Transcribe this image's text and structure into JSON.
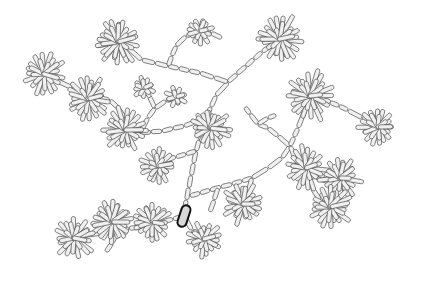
{
  "figure": {
    "width": 422,
    "height": 283,
    "background_color": "#ffffff",
    "rod_fill_color": "#f0f0f0",
    "rod_stroke_color": "#4a4a4a",
    "rod_stroke_width": 0.7,
    "highlight_fill_color": "#d8d8d8",
    "highlight_stroke_color": "#111111",
    "highlight_stroke_width": 2.0,
    "rod_width": 4.2,
    "cluster_rod_length": 15,
    "chain_rod_length": 13
  },
  "highlight": {
    "name": "highlighted-rod",
    "x": 184,
    "y": 216,
    "angle": 108,
    "length": 22,
    "width": 9
  },
  "chains": [
    {
      "name": "trunk-lower",
      "points": [
        [
          184,
          212
        ],
        [
          196,
          151
        ],
        [
          206,
          118
        ],
        [
          216,
          96
        ],
        [
          228,
          82
        ]
      ]
    },
    {
      "name": "trunk-upper-left-limb",
      "points": [
        [
          228,
          82
        ],
        [
          200,
          73
        ],
        [
          168,
          66
        ],
        [
          142,
          60
        ]
      ]
    },
    {
      "name": "branch-upper-left-top",
      "points": [
        [
          168,
          66
        ],
        [
          176,
          46
        ],
        [
          186,
          36
        ],
        [
          200,
          31
        ]
      ]
    },
    {
      "name": "branch-upper-left-mid",
      "points": [
        [
          142,
          60
        ],
        [
          128,
          48
        ],
        [
          118,
          42
        ]
      ]
    },
    {
      "name": "branch-top-right-stub",
      "points": [
        [
          200,
          31
        ],
        [
          211,
          33
        ],
        [
          222,
          38
        ]
      ]
    },
    {
      "name": "trunk-upper-right-limb",
      "points": [
        [
          228,
          82
        ],
        [
          246,
          66
        ],
        [
          262,
          52
        ],
        [
          276,
          42
        ]
      ]
    },
    {
      "name": "branch-left-of-trunk-a",
      "points": [
        [
          206,
          118
        ],
        [
          184,
          126
        ],
        [
          162,
          131
        ],
        [
          140,
          133
        ]
      ]
    },
    {
      "name": "branch-left-of-trunk-b",
      "points": [
        [
          196,
          151
        ],
        [
          176,
          157
        ],
        [
          158,
          163
        ]
      ]
    },
    {
      "name": "branch-left-mid",
      "points": [
        [
          140,
          133
        ],
        [
          126,
          120
        ],
        [
          118,
          108
        ],
        [
          110,
          100
        ]
      ]
    },
    {
      "name": "branch-left-to-cluster",
      "points": [
        [
          110,
          100
        ],
        [
          92,
          96
        ],
        [
          76,
          92
        ]
      ]
    },
    {
      "name": "branch-far-left",
      "points": [
        [
          92,
          96
        ],
        [
          72,
          88
        ],
        [
          56,
          80
        ],
        [
          44,
          74
        ]
      ]
    },
    {
      "name": "branch-left-upper-fan",
      "points": [
        [
          140,
          133
        ],
        [
          148,
          118
        ],
        [
          155,
          108
        ]
      ]
    },
    {
      "name": "branch-left-fan-split-a",
      "points": [
        [
          155,
          108
        ],
        [
          149,
          96
        ],
        [
          144,
          88
        ]
      ]
    },
    {
      "name": "branch-left-fan-split-b",
      "points": [
        [
          155,
          108
        ],
        [
          166,
          101
        ],
        [
          176,
          97
        ]
      ]
    },
    {
      "name": "branch-lower-left-chain",
      "points": [
        [
          184,
          216
        ],
        [
          162,
          222
        ],
        [
          140,
          227
        ],
        [
          118,
          230
        ]
      ]
    },
    {
      "name": "branch-lower-left-far",
      "points": [
        [
          118,
          230
        ],
        [
          100,
          233
        ],
        [
          82,
          236
        ],
        [
          66,
          238
        ]
      ]
    },
    {
      "name": "branch-lower-left-down",
      "points": [
        [
          118,
          230
        ],
        [
          112,
          243
        ],
        [
          106,
          252
        ]
      ]
    },
    {
      "name": "branch-lower-right-down",
      "points": [
        [
          184,
          216
        ],
        [
          192,
          230
        ],
        [
          200,
          240
        ]
      ]
    },
    {
      "name": "branch-right-lower-main",
      "points": [
        [
          190,
          196
        ],
        [
          210,
          190
        ],
        [
          232,
          184
        ],
        [
          252,
          178
        ]
      ]
    },
    {
      "name": "branch-right-lower-to-fan",
      "points": [
        [
          252,
          178
        ],
        [
          268,
          168
        ],
        [
          282,
          158
        ],
        [
          290,
          146
        ]
      ]
    },
    {
      "name": "branch-right-small-fan-stem",
      "points": [
        [
          290,
          146
        ],
        [
          278,
          136
        ],
        [
          268,
          128
        ],
        [
          258,
          124
        ]
      ]
    },
    {
      "name": "branch-right-small-fan-a",
      "points": [
        [
          258,
          124
        ],
        [
          250,
          114
        ],
        [
          245,
          107
        ]
      ]
    },
    {
      "name": "branch-right-small-fan-b",
      "points": [
        [
          258,
          124
        ],
        [
          268,
          118
        ],
        [
          276,
          115
        ]
      ]
    },
    {
      "name": "branch-right-up-to-cluster",
      "points": [
        [
          290,
          146
        ],
        [
          298,
          128
        ],
        [
          305,
          110
        ],
        [
          310,
          98
        ]
      ]
    },
    {
      "name": "branch-right-cluster-to-far",
      "points": [
        [
          310,
          98
        ],
        [
          330,
          102
        ],
        [
          348,
          110
        ],
        [
          362,
          118
        ]
      ]
    },
    {
      "name": "branch-right-far-tail",
      "points": [
        [
          362,
          118
        ],
        [
          372,
          122
        ],
        [
          380,
          126
        ]
      ]
    },
    {
      "name": "branch-right-down-a",
      "points": [
        [
          290,
          146
        ],
        [
          296,
          160
        ],
        [
          302,
          172
        ]
      ]
    },
    {
      "name": "branch-right-down-b",
      "points": [
        [
          302,
          172
        ],
        [
          316,
          178
        ],
        [
          330,
          182
        ]
      ]
    },
    {
      "name": "branch-right-down-c",
      "points": [
        [
          302,
          172
        ],
        [
          312,
          188
        ],
        [
          320,
          200
        ]
      ]
    },
    {
      "name": "branch-bottom-right-spur",
      "points": [
        [
          252,
          178
        ],
        [
          248,
          192
        ],
        [
          244,
          202
        ]
      ]
    },
    {
      "name": "branch-bottom-mid-spur",
      "points": [
        [
          218,
          188
        ],
        [
          214,
          200
        ],
        [
          210,
          212
        ]
      ]
    },
    {
      "name": "branch-upper-left-small-fan",
      "points": [
        [
          118,
          42
        ],
        [
          110,
          30
        ],
        [
          104,
          22
        ]
      ]
    },
    {
      "name": "branch-upper-left-small-fan-b",
      "points": [
        [
          118,
          42
        ],
        [
          106,
          44
        ],
        [
          96,
          46
        ]
      ]
    }
  ],
  "clusters": [
    {
      "name": "cluster-top-left-a",
      "x": 118,
      "y": 42,
      "radius": 21,
      "rods": 18,
      "start_angle": 8
    },
    {
      "name": "cluster-top-left-b",
      "x": 200,
      "y": 31,
      "radius": 14,
      "rods": 11,
      "start_angle": 20
    },
    {
      "name": "cluster-top-right",
      "x": 280,
      "y": 39,
      "radius": 22,
      "rods": 19,
      "start_angle": 12
    },
    {
      "name": "cluster-far-left",
      "x": 44,
      "y": 74,
      "radius": 20,
      "rods": 17,
      "start_angle": 30
    },
    {
      "name": "cluster-left-mid",
      "x": 88,
      "y": 99,
      "radius": 21,
      "rods": 18,
      "start_angle": 5
    },
    {
      "name": "cluster-left-inner",
      "x": 125,
      "y": 130,
      "radius": 21,
      "rods": 18,
      "start_angle": 17
    },
    {
      "name": "cluster-center",
      "x": 210,
      "y": 128,
      "radius": 20,
      "rods": 18,
      "start_angle": 25
    },
    {
      "name": "cluster-left-lower",
      "x": 158,
      "y": 166,
      "radius": 17,
      "rods": 15,
      "start_angle": 9
    },
    {
      "name": "cluster-right-upper",
      "x": 310,
      "y": 96,
      "radius": 23,
      "rods": 20,
      "start_angle": 14
    },
    {
      "name": "cluster-right-far",
      "x": 378,
      "y": 127,
      "radius": 18,
      "rods": 16,
      "start_angle": 22
    },
    {
      "name": "cluster-right-mid",
      "x": 306,
      "y": 168,
      "radius": 20,
      "rods": 17,
      "start_angle": 3
    },
    {
      "name": "cluster-right-lower-a",
      "x": 340,
      "y": 178,
      "radius": 20,
      "rods": 17,
      "start_angle": 28
    },
    {
      "name": "cluster-right-lower-b",
      "x": 330,
      "y": 207,
      "radius": 21,
      "rods": 18,
      "start_angle": 11
    },
    {
      "name": "cluster-bottom-right",
      "x": 243,
      "y": 204,
      "radius": 20,
      "rods": 17,
      "start_angle": 19
    },
    {
      "name": "cluster-bottom-mid",
      "x": 204,
      "y": 239,
      "radius": 17,
      "rods": 15,
      "start_angle": 6
    },
    {
      "name": "cluster-bottom-left-a",
      "x": 152,
      "y": 222,
      "radius": 19,
      "rods": 16,
      "start_angle": 24
    },
    {
      "name": "cluster-bottom-left-b",
      "x": 112,
      "y": 222,
      "radius": 21,
      "rods": 18,
      "start_angle": 13
    },
    {
      "name": "cluster-bottom-left-c",
      "x": 74,
      "y": 238,
      "radius": 20,
      "rods": 17,
      "start_angle": 31
    },
    {
      "name": "cluster-mid-left-tip",
      "x": 144,
      "y": 88,
      "radius": 12,
      "rods": 9,
      "start_angle": 15
    },
    {
      "name": "cluster-upper-mid-tip",
      "x": 176,
      "y": 97,
      "radius": 11,
      "rods": 8,
      "start_angle": 27
    }
  ],
  "legend": {
    "visible": false,
    "items": []
  }
}
